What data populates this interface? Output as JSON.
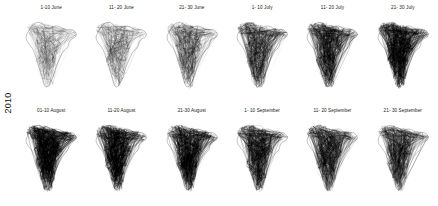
{
  "figure": {
    "background_color": "#ffffff",
    "row_label": "2010",
    "stroke_color": "#000000"
  },
  "chart_data": {
    "type": "map",
    "title": "",
    "subtitle": "",
    "xlabel": "",
    "ylabel": "",
    "grid": false,
    "legend": null,
    "row_labels": [
      "2010"
    ],
    "layout": {
      "rows": 2,
      "columns": 6
    },
    "region": "India",
    "panels": [
      {
        "label": "1-10 June",
        "row": 0,
        "col": 0,
        "density": 0.3,
        "ink": 0.3,
        "stroke_width": 0.17,
        "seed": 11
      },
      {
        "label": "11- 20 June",
        "row": 0,
        "col": 1,
        "density": 0.36,
        "ink": 0.36,
        "stroke_width": 0.18,
        "seed": 23
      },
      {
        "label": "21- 30 June",
        "row": 0,
        "col": 2,
        "density": 0.46,
        "ink": 0.46,
        "stroke_width": 0.2,
        "seed": 37
      },
      {
        "label": "1- 10 July",
        "row": 0,
        "col": 3,
        "density": 0.62,
        "ink": 0.62,
        "stroke_width": 0.23,
        "seed": 49
      },
      {
        "label": "11- 20 July",
        "row": 0,
        "col": 4,
        "density": 0.7,
        "ink": 0.7,
        "stroke_width": 0.25,
        "seed": 61
      },
      {
        "label": "21- 30 July",
        "row": 0,
        "col": 5,
        "density": 0.82,
        "ink": 0.82,
        "stroke_width": 0.28,
        "seed": 73
      },
      {
        "label": "01-10 August",
        "row": 1,
        "col": 0,
        "density": 0.86,
        "ink": 0.86,
        "stroke_width": 0.29,
        "seed": 89
      },
      {
        "label": "11-20 August",
        "row": 1,
        "col": 1,
        "density": 0.84,
        "ink": 0.84,
        "stroke_width": 0.28,
        "seed": 97
      },
      {
        "label": "21-30 August",
        "row": 1,
        "col": 2,
        "density": 0.78,
        "ink": 0.78,
        "stroke_width": 0.27,
        "seed": 103
      },
      {
        "label": "1- 10 September",
        "row": 1,
        "col": 3,
        "density": 0.74,
        "ink": 0.74,
        "stroke_width": 0.26,
        "seed": 113
      },
      {
        "label": "11- 20 September",
        "row": 1,
        "col": 4,
        "density": 0.68,
        "ink": 0.68,
        "stroke_width": 0.25,
        "seed": 127
      },
      {
        "label": "21- 30 September",
        "row": 1,
        "col": 5,
        "density": 0.64,
        "ink": 0.64,
        "stroke_width": 0.24,
        "seed": 139
      }
    ]
  }
}
